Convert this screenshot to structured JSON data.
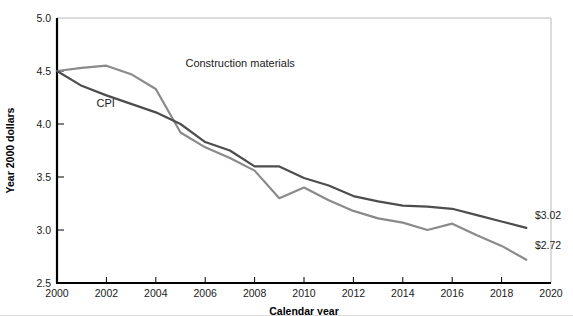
{
  "chart_data": {
    "type": "line",
    "title": "",
    "xlabel": "Calendar year",
    "ylabel": "Year 2000 dollars",
    "xlim": [
      2000,
      2020
    ],
    "ylim": [
      2.5,
      5.0
    ],
    "xticks": [
      "2000",
      "2002",
      "2004",
      "2006",
      "2008",
      "2010",
      "2012",
      "2014",
      "2016",
      "2018",
      "2020"
    ],
    "xtick_values": [
      2000,
      2002,
      2004,
      2006,
      2008,
      2010,
      2012,
      2014,
      2016,
      2018,
      2020
    ],
    "yticks": [
      "2.5",
      "3.0",
      "3.5",
      "4.0",
      "4.5",
      "5.0"
    ],
    "ytick_values": [
      2.5,
      3.0,
      3.5,
      4.0,
      4.5,
      5.0
    ],
    "grid": false,
    "legend_position": "inline-annotation",
    "x": [
      2000,
      2001,
      2002,
      2003,
      2004,
      2005,
      2006,
      2007,
      2008,
      2009,
      2010,
      2011,
      2012,
      2013,
      2014,
      2015,
      2016,
      2017,
      2018,
      2019
    ],
    "series": [
      {
        "name": "Construction materials",
        "color": "#8a8a8a",
        "stroke_width": 2.2,
        "label_x": 2005.2,
        "label_y": 4.54,
        "end_label": "",
        "values": [
          4.5,
          4.53,
          4.55,
          4.47,
          4.33,
          3.92,
          3.78,
          3.68,
          3.56,
          3.3,
          3.4,
          3.28,
          3.18,
          3.11,
          3.07,
          3.0,
          3.06,
          2.95,
          2.85,
          2.72
        ]
      },
      {
        "name": "CPI",
        "color": "#4d4d4d",
        "stroke_width": 2.2,
        "label_x": 2001.6,
        "label_y": 4.16,
        "end_label": "",
        "values": [
          4.5,
          4.36,
          4.27,
          4.19,
          4.11,
          4.0,
          3.83,
          3.75,
          3.6,
          3.6,
          3.49,
          3.42,
          3.32,
          3.27,
          3.23,
          3.22,
          3.2,
          3.14,
          3.08,
          3.02
        ]
      }
    ],
    "annotations": [
      {
        "name": "cpi-end-value",
        "text": "$3.02",
        "x": 2019.35,
        "y": 3.1
      },
      {
        "name": "construction-end-value",
        "text": "$2.72",
        "x": 2019.35,
        "y": 2.82
      }
    ]
  }
}
